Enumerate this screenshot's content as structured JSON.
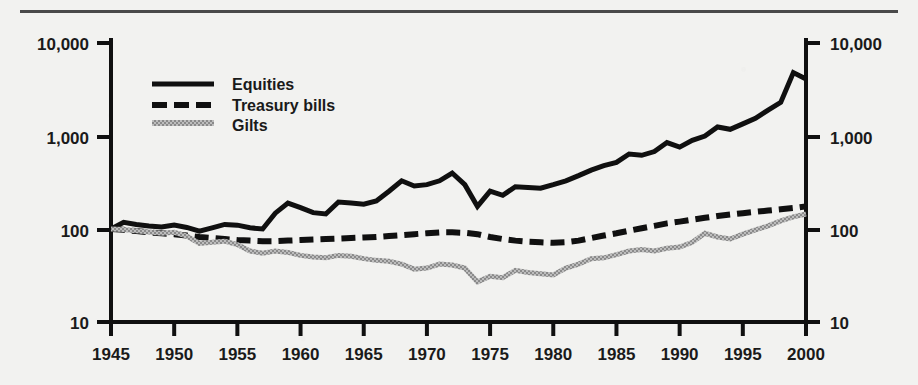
{
  "chart_data": {
    "type": "line",
    "title": "",
    "xlabel": "",
    "ylabel": "",
    "scale": "log",
    "grid": false,
    "legend_position": "top-left-inside",
    "xlim": [
      1945,
      2000
    ],
    "ylim": [
      10,
      10000
    ],
    "x_ticks": [
      1945,
      1950,
      1955,
      1960,
      1965,
      1970,
      1975,
      1980,
      1985,
      1990,
      1995,
      2000
    ],
    "x_tick_labels": [
      "1945",
      "1950",
      "1955",
      "1960",
      "1965",
      "1970",
      "1975",
      "1980",
      "1985",
      "1990",
      "1995",
      "2000"
    ],
    "y_ticks": [
      10,
      100,
      1000,
      10000
    ],
    "y_tick_labels_left": [
      "10",
      "100",
      "1,000",
      "10,000"
    ],
    "y_tick_labels_right": [
      "10",
      "100",
      "1,000",
      "10,000"
    ],
    "series": [
      {
        "name": "Equities",
        "style": "solid",
        "color": "#101010",
        "x": [
          1945,
          1946,
          1947,
          1948,
          1949,
          1950,
          1951,
          1952,
          1953,
          1954,
          1955,
          1956,
          1957,
          1958,
          1959,
          1960,
          1961,
          1962,
          1963,
          1964,
          1965,
          1966,
          1967,
          1968,
          1969,
          1970,
          1971,
          1972,
          1973,
          1974,
          1975,
          1976,
          1977,
          1978,
          1979,
          1980,
          1981,
          1982,
          1983,
          1984,
          1985,
          1986,
          1987,
          1988,
          1989,
          1990,
          1991,
          1992,
          1993,
          1994,
          1995,
          1996,
          1997,
          1998,
          1999,
          2000
        ],
        "y": [
          100,
          118,
          112,
          108,
          105,
          110,
          104,
          95,
          103,
          112,
          110,
          103,
          100,
          148,
          190,
          170,
          150,
          145,
          195,
          190,
          185,
          200,
          255,
          330,
          290,
          300,
          330,
          400,
          300,
          175,
          255,
          230,
          285,
          280,
          275,
          300,
          330,
          375,
          430,
          480,
          520,
          640,
          620,
          680,
          850,
          760,
          900,
          1000,
          1250,
          1180,
          1350,
          1550,
          1900,
          2300,
          4800,
          4100
        ]
      },
      {
        "name": "Treasury bills",
        "style": "dashed",
        "color": "#101010",
        "x": [
          1945,
          1946,
          1947,
          1948,
          1949,
          1950,
          1951,
          1952,
          1953,
          1954,
          1955,
          1956,
          1957,
          1958,
          1959,
          1960,
          1961,
          1962,
          1963,
          1964,
          1965,
          1966,
          1967,
          1968,
          1969,
          1970,
          1971,
          1972,
          1973,
          1974,
          1975,
          1976,
          1977,
          1978,
          1979,
          1980,
          1981,
          1982,
          1983,
          1984,
          1985,
          1986,
          1987,
          1988,
          1989,
          1990,
          1991,
          1992,
          1993,
          1994,
          1995,
          1996,
          1997,
          1998,
          1999,
          2000
        ],
        "y": [
          100,
          98,
          95,
          92,
          90,
          88,
          85,
          82,
          80,
          78,
          76,
          75,
          74,
          74,
          75,
          76,
          77,
          78,
          79,
          80,
          81,
          82,
          84,
          86,
          88,
          90,
          92,
          92,
          91,
          88,
          82,
          78,
          75,
          73,
          72,
          71,
          72,
          75,
          80,
          85,
          90,
          96,
          102,
          108,
          115,
          120,
          126,
          132,
          138,
          143,
          148,
          153,
          158,
          163,
          168,
          175
        ]
      },
      {
        "name": "Gilts",
        "style": "textured",
        "color": "#8a8a8a",
        "x": [
          1945,
          1946,
          1947,
          1948,
          1949,
          1950,
          1951,
          1952,
          1953,
          1954,
          1955,
          1956,
          1957,
          1958,
          1959,
          1960,
          1961,
          1962,
          1963,
          1964,
          1965,
          1966,
          1967,
          1968,
          1969,
          1970,
          1971,
          1972,
          1973,
          1974,
          1975,
          1976,
          1977,
          1978,
          1979,
          1980,
          1981,
          1982,
          1983,
          1984,
          1985,
          1986,
          1987,
          1988,
          1989,
          1990,
          1991,
          1992,
          1993,
          1994,
          1995,
          1996,
          1997,
          1998,
          1999,
          2000
        ],
        "y": [
          100,
          99,
          96,
          93,
          90,
          92,
          84,
          70,
          72,
          74,
          68,
          58,
          55,
          58,
          56,
          52,
          50,
          49,
          52,
          51,
          48,
          46,
          45,
          42,
          37,
          38,
          42,
          41,
          38,
          27,
          31,
          30,
          36,
          34,
          33,
          32,
          38,
          42,
          48,
          49,
          53,
          58,
          60,
          58,
          62,
          64,
          72,
          90,
          82,
          78,
          88,
          98,
          108,
          122,
          135,
          145
        ]
      }
    ]
  },
  "legend": {
    "items": [
      {
        "label": "Equities",
        "swatch": "solid-line-swatch"
      },
      {
        "label": "Treasury bills",
        "swatch": "dashed-line-swatch"
      },
      {
        "label": "Gilts",
        "swatch": "textured-line-swatch"
      }
    ]
  },
  "colors": {
    "background": "#f2f2f0",
    "ink": "#101010",
    "gilts": "#8a8a8a",
    "rule": "#4a4a4a"
  }
}
